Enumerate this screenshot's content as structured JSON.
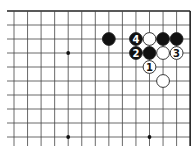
{
  "diagram": {
    "type": "go-board-fragment",
    "grid": {
      "x0": 14,
      "y0": 11,
      "spacing_x": 13.55,
      "spacing_y": 14,
      "cols": 14,
      "rows": 10,
      "edges": {
        "top": true,
        "right": true,
        "left": false,
        "bottom": false
      },
      "line_color": "#444444",
      "edge_color": "#222222"
    },
    "star_points": [
      {
        "col": 4,
        "row": 3
      },
      {
        "col": 4,
        "row": 9
      },
      {
        "col": 10,
        "row": 9
      }
    ],
    "stones": [
      {
        "color": "black",
        "col": 7,
        "row": 2,
        "label": ""
      },
      {
        "color": "black",
        "col": 9,
        "row": 2,
        "label": "4"
      },
      {
        "color": "white",
        "col": 10,
        "row": 2,
        "label": ""
      },
      {
        "color": "black",
        "col": 11,
        "row": 2,
        "label": ""
      },
      {
        "color": "black",
        "col": 12,
        "row": 2,
        "label": ""
      },
      {
        "color": "black",
        "col": 9,
        "row": 3,
        "label": "2"
      },
      {
        "color": "black",
        "col": 10,
        "row": 3,
        "label": ""
      },
      {
        "color": "white",
        "col": 11,
        "row": 3,
        "label": ""
      },
      {
        "color": "white",
        "col": 12,
        "row": 3,
        "label": "3"
      },
      {
        "color": "white",
        "col": 10,
        "row": 4,
        "label": "1"
      },
      {
        "color": "white",
        "col": 11,
        "row": 5,
        "label": ""
      }
    ],
    "colors": {
      "black": "#111111",
      "white": "#ffffff",
      "stone_outline": "#222222"
    }
  }
}
